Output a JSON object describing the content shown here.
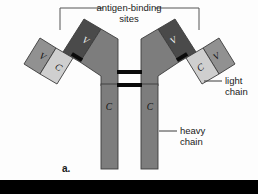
{
  "figure": {
    "panel_letter": "a.",
    "background_color": "#fdfdfd",
    "bottom_band_color": "#000000"
  },
  "labels": {
    "antigen_binding_line1": "antigen-binding",
    "antigen_binding_line2": "sites",
    "light_chain_line1": "light",
    "light_chain_line2": "chain",
    "heavy_chain_line1": "heavy",
    "heavy_chain_line2": "chain"
  },
  "domains": {
    "heavy_variable_left": "V",
    "heavy_variable_right": "V",
    "light_variable_left": "V",
    "light_variable_right": "V",
    "light_constant_left": "C",
    "light_constant_right": "C",
    "heavy_constant_left": "C",
    "heavy_constant_right": "C"
  },
  "colors": {
    "heavy_variable_fill": "#4a4a4a",
    "heavy_constant_fill": "#7d7d7d",
    "light_variable_fill": "#919191",
    "light_constant_fill": "#cfcfcf",
    "outline_stroke": "#3c3c3c",
    "disulfide_bond": "#0a0a0a",
    "bracket_stroke": "#555555",
    "leader_stroke": "#3a3a3a",
    "text_color": "#1a1a1a"
  },
  "icons": {
    "bracket": "antigen-binding-bracket-icon",
    "disulfide": "disulfide-bond-icon"
  }
}
